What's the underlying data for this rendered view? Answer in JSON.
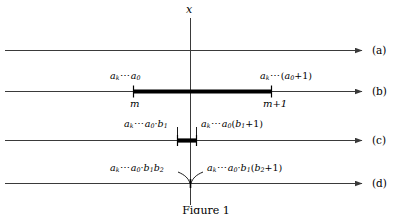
{
  "figure": {
    "axis_label": "x",
    "caption": "Figure 1",
    "line_color": "#3a3a3a",
    "bar_color": "#000000",
    "text_color": "#000000",
    "background": "#ffffff"
  },
  "lines": [
    {
      "tag": "(a)",
      "y": 50
    },
    {
      "tag": "(b)",
      "y": 91
    },
    {
      "tag": "(c)",
      "y": 140
    },
    {
      "tag": "(d)",
      "y": 183
    }
  ],
  "line_b": {
    "left_label": {
      "base": "a",
      "sub": "k",
      "dots": "⋯",
      "tail_open": "",
      "tail_base": "a",
      "tail_sub": "0",
      "tail_close": ""
    },
    "left_label_text": "a_k ⋯ a_0",
    "right_label_text": "a_k ⋯ (a_0+1)",
    "left_endpoint": "m",
    "right_endpoint": "m+1"
  },
  "line_c": {
    "left_label_text": "a_k ⋯ a_0·b_1",
    "right_label_text": "a_k ⋯ a_0(b_1+1)"
  },
  "line_d": {
    "left_label_text": "a_k ⋯ a_0·b_1b_2",
    "right_label_text": "a_k ⋯ a_0·b_1(b_2+1)"
  },
  "parts": {
    "a": "a",
    "b": "b",
    "k": "k",
    "zero": "0",
    "one": "1",
    "two": "2",
    "dots": "⋯",
    "dot": "·",
    "plus_one": "+1",
    "paren_open": "(",
    "paren_close": ")",
    "m": "m",
    "m_plus_one": "m+1"
  }
}
